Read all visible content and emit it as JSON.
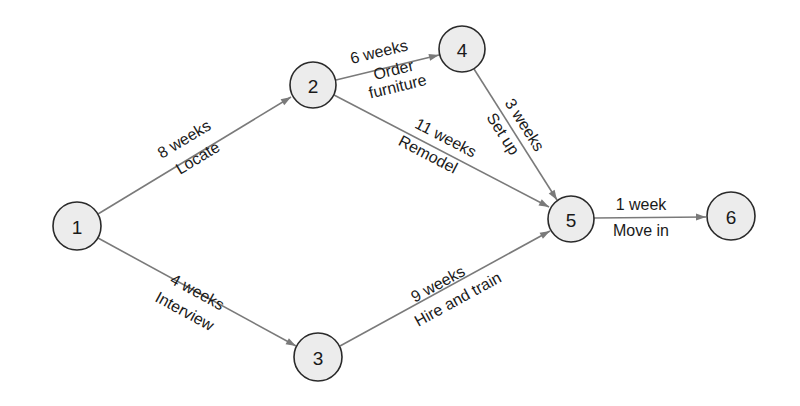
{
  "diagram": {
    "type": "activity-network",
    "colors": {
      "edge": "#7a7a7a",
      "node_fill": "#ececec",
      "node_stroke": "#2a2a2a",
      "text": "#1a1a1a"
    },
    "nodes": [
      {
        "id": "1",
        "label": "1",
        "x": 77,
        "y": 226,
        "r": 24
      },
      {
        "id": "2",
        "label": "2",
        "x": 313,
        "y": 85,
        "r": 23
      },
      {
        "id": "3",
        "label": "3",
        "x": 318,
        "y": 357,
        "r": 24
      },
      {
        "id": "4",
        "label": "4",
        "x": 462,
        "y": 49,
        "r": 23
      },
      {
        "id": "5",
        "label": "5",
        "x": 571,
        "y": 219,
        "r": 23
      },
      {
        "id": "6",
        "label": "6",
        "x": 731,
        "y": 216,
        "r": 24
      }
    ],
    "edges": [
      {
        "from": "1",
        "to": "2",
        "duration": "8 weeks",
        "activity": "Locate"
      },
      {
        "from": "1",
        "to": "3",
        "duration": "4 weeks",
        "activity": "Interview"
      },
      {
        "from": "2",
        "to": "4",
        "duration": "6 weeks",
        "activity": "Order furniture",
        "activity_lines": [
          "Order",
          "furniture"
        ]
      },
      {
        "from": "2",
        "to": "5",
        "duration": "11 weeks",
        "activity": "Remodel"
      },
      {
        "from": "4",
        "to": "5",
        "duration": "3 weeks",
        "activity": "Set up"
      },
      {
        "from": "3",
        "to": "5",
        "duration": "9 weeks",
        "activity": "Hire and train"
      },
      {
        "from": "5",
        "to": "6",
        "duration": "1 week",
        "activity": "Move in"
      }
    ]
  }
}
